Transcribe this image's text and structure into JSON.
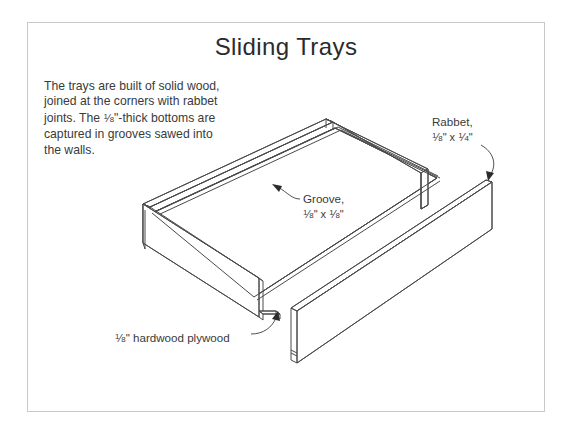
{
  "page": {
    "title": "Sliding Trays",
    "body_text": "The trays are built of solid wood, joined at the corners with rabbet joints. The ⅛\"-thick bottoms are captured in grooves sawed into the walls.",
    "frame_color": "#c9c9c9",
    "line_color": "#4a4a4a",
    "text_color": "#3a3a3a",
    "background": "#ffffff"
  },
  "labels": {
    "groove": {
      "name": "Groove,",
      "dimension": "⅛\" x ⅛\"",
      "num1": "1",
      "den1": "8",
      "num2": "1",
      "den2": "8"
    },
    "rabbet": {
      "name": "Rabbet,",
      "dimension": "⅛\" x ¼\"",
      "num1": "1",
      "den1": "8",
      "num2": "1",
      "den2": "4"
    },
    "plywood": {
      "text": "⅛\" hardwood plywood",
      "num": "1",
      "den": "8",
      "rest": "\" hardwood plywood"
    }
  },
  "drawing": {
    "kind": "isometric-line-drawing",
    "subject": "sliding tray drawer box with detached front panel",
    "parts": [
      "left tray wall",
      "back tray wall",
      "right tray wall",
      "plywood bottom panel",
      "detached front wall with groove"
    ]
  }
}
